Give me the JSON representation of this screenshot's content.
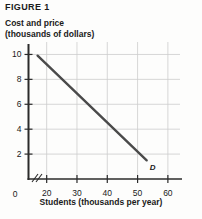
{
  "figure": {
    "label": "FIGURE 1"
  },
  "axis_titles": {
    "y_line1": "Cost and price",
    "y_line2": "(thousands of dollars)",
    "x": "Students (thousands per year)"
  },
  "chart_data": {
    "type": "line",
    "title": "FIGURE 1",
    "xlabel": "Students (thousands per year)",
    "ylabel": "Cost and price (thousands of dollars)",
    "xlim": [
      14,
      64
    ],
    "ylim": [
      0,
      11
    ],
    "grid": true,
    "legend": "none",
    "axis_break_x": true,
    "xticks": [
      20,
      30,
      40,
      50,
      60
    ],
    "xtick_labels": [
      "20",
      "30",
      "40",
      "50",
      "60"
    ],
    "yticks": [
      2,
      4,
      6,
      8,
      10
    ],
    "ytick_labels": [
      "2",
      "4",
      "6",
      "8",
      "10"
    ],
    "origin_label": "0",
    "series": [
      {
        "name": "D",
        "annotation": "D",
        "line_color": "#4a4a4a",
        "x": [
          17,
          53
        ],
        "y": [
          9.9,
          1.5
        ]
      }
    ]
  }
}
